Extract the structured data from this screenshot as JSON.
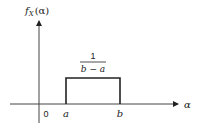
{
  "diagram": {
    "y_axis_label_f": "f",
    "y_axis_label_sub": "X",
    "y_axis_label_arg": "(α)",
    "x_axis_label": "α",
    "origin_label": "0",
    "lower_bound_label": "a",
    "upper_bound_label": "b",
    "height_numerator": "1",
    "height_denominator": "b − a",
    "colors": {
      "line": "#222222",
      "background": "#ffffff"
    }
  }
}
